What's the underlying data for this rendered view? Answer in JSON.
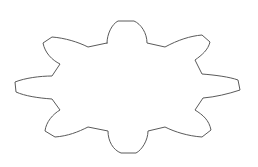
{
  "diagram": {
    "type": "outline-shape",
    "shape": "gear-like flower with 8 lobes",
    "lobe_count": 8,
    "colors": {
      "background": "#ffffff",
      "stroke": "#5a5a5a",
      "fill": "#ffffff"
    },
    "stroke_width": 1,
    "path": "M 107 43 C 107 34, 112 24, 118 21 L 134 21 C 141 24, 147 33, 147 43 L 165 47 C 178 40, 190 36, 202 35 L 210 42 C 208 50, 202 55, 195 60 L 202 74 C 215 75, 230 77, 238 80 L 240 90 C 228 94, 215 97, 203 98 L 195 110 C 203 115, 209 120, 211 130 L 202 137 C 188 136, 175 132, 165 127 L 148 131 C 148 140, 142 150, 136 153 L 121 153 C 113 150, 108 141, 108 131 L 88 127 C 78 132, 68 136, 55 137 L 45 131 C 46 122, 53 114, 60 110 L 52 99 C 38 98, 25 96, 16 92 L 15 82 C 25 78, 40 76, 52 76 L 60 64 C 52 60, 45 53, 43 43 L 52 37 C 65 38, 78 42, 88 47 L 107 43 Z"
  }
}
